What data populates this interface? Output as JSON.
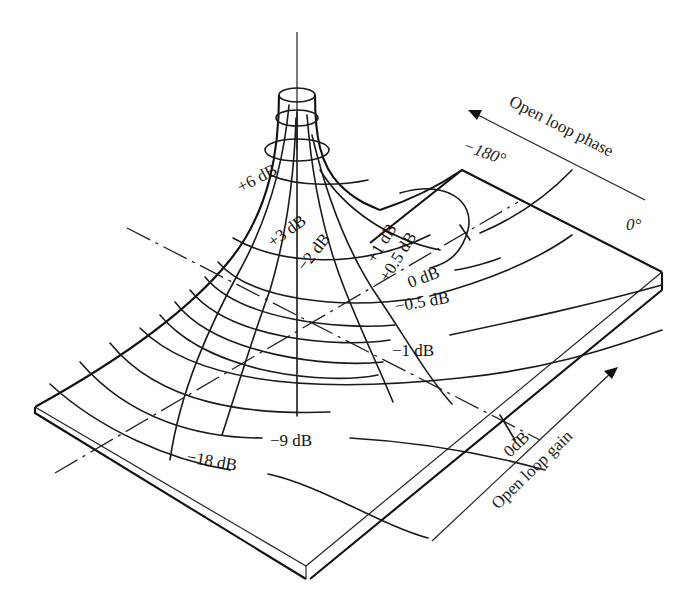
{
  "figure": {
    "axes": {
      "phase": {
        "label": "Open loop phase",
        "start_label": "−180°",
        "end_label": "0°"
      },
      "gain": {
        "label": "Open loop gain",
        "zero_label": "0dB"
      }
    },
    "contour_labels": [
      {
        "id": "p6",
        "text": "+6 dB"
      },
      {
        "id": "p3",
        "text": "+3 dB"
      },
      {
        "id": "m2",
        "text": "−2 dB"
      },
      {
        "id": "p1",
        "text": "+1 dB"
      },
      {
        "id": "p05",
        "text": "+0.5 dB"
      },
      {
        "id": "z0",
        "text": "0 dB"
      },
      {
        "id": "m05",
        "text": "−0.5 dB"
      },
      {
        "id": "m1",
        "text": "−1 dB"
      },
      {
        "id": "m9",
        "text": "−9 dB"
      },
      {
        "id": "m18",
        "text": "−18 dB"
      }
    ],
    "colors": {
      "line": "#1a1a1a",
      "background": "#ffffff"
    }
  }
}
